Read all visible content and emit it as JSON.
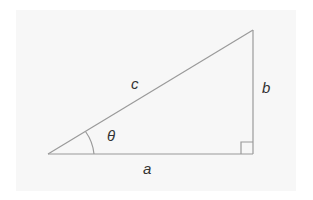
{
  "diagram": {
    "type": "right-triangle",
    "colors": {
      "background": "#f7f7f7",
      "line": "#999999",
      "text": "#333333"
    },
    "labels": {
      "hypotenuse": "c",
      "opposite": "b",
      "adjacent": "a",
      "angle": "θ"
    },
    "right_angle_marker": true
  }
}
